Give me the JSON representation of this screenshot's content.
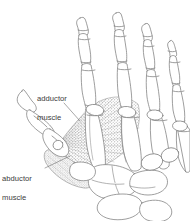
{
  "figure": {
    "type": "anatomical-illustration",
    "background_color": "#ffffff",
    "line_color": "#7d7d7d",
    "stipple_color": "#9a9a9a",
    "text_color": "#3b3b3b"
  },
  "labels": {
    "adductor": {
      "text": "adductor\nmuscle",
      "line1": "adductor",
      "line2": "muscle"
    },
    "abductor": {
      "text": "abductor\nmuscle",
      "line1": "abductor",
      "line2": "muscle"
    }
  },
  "structures": {
    "fingers": [
      {
        "name": "index-finger"
      },
      {
        "name": "middle-finger"
      },
      {
        "name": "ring-finger"
      },
      {
        "name": "little-finger"
      }
    ],
    "thumb": {
      "name": "thumb"
    },
    "metacarpals": {
      "name": "metacarpal-bones"
    },
    "carpals": {
      "name": "carpal-bones"
    },
    "adductor_muscle": {
      "name": "adductor-pollicis-muscle"
    },
    "abductor_muscle": {
      "name": "abductor-pollicis-muscle"
    }
  }
}
